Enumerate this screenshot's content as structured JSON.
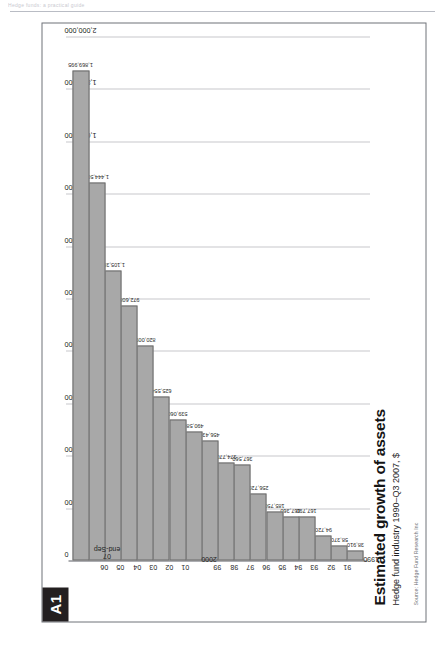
{
  "page": {
    "running_header": "Hedge funds: a practical guide",
    "badge": "A1"
  },
  "figure": {
    "title": "Estimated growth of assets",
    "subtitle": "Hedge fund industry 1990–Q3 2007, $",
    "source": "Source: Hedge Fund Research Inc"
  },
  "chart_data": {
    "type": "bar",
    "orientation": "horizontal",
    "title": "Estimated growth of assets",
    "subtitle": "Hedge fund industry 1990–Q3 2007, $",
    "xlabel": "",
    "ylabel": "",
    "xlim": [
      0,
      2000000
    ],
    "grid": true,
    "legend": "none",
    "tick_labels": [
      "0",
      "200,000",
      "400,000",
      "600,000",
      "800,000",
      "1,000,000",
      "1,200,000",
      "1,400,000",
      "1,600,000",
      "1,800,000",
      "2,000,000"
    ],
    "ticks": [
      0,
      200000,
      400000,
      600000,
      800000,
      1000000,
      1200000,
      1400000,
      1600000,
      1800000,
      2000000
    ],
    "categories": [
      "1990",
      "91",
      "92",
      "93",
      "94",
      "95",
      "96",
      "97",
      "98",
      "99",
      "2000",
      "01",
      "02",
      "03",
      "04",
      "05",
      "06",
      "07\nend-Sep"
    ],
    "values": [
      38910,
      58370,
      94720,
      167790,
      167360,
      185750,
      256720,
      367560,
      374770,
      456430,
      490580,
      539060,
      625554,
      820009,
      972608,
      1105385,
      1444508,
      1869995
    ],
    "value_labels": [
      "38,910",
      "58,370",
      "94,720",
      "167,790",
      "167,360",
      "185,750",
      "256,720",
      "367,560",
      "374,770",
      "456,430",
      "490,580",
      "539,060",
      "625,554",
      "820,009",
      "972,608",
      "1,105,385",
      "1,444,508",
      "1,869,995"
    ],
    "bar_color": "#a8a8a8",
    "bar_border_color": "#6b6b6b"
  }
}
